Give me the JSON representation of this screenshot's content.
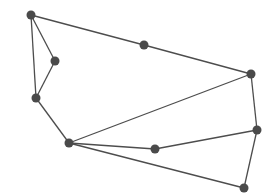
{
  "graph": {
    "width": 264,
    "height": 194,
    "colors": {
      "node": "#4a4a4a",
      "edge": "#4d4d4d",
      "background": "#ffffff"
    },
    "node_radius": 4.5,
    "nodes": [
      {
        "id": "A",
        "x": 31,
        "y": 15
      },
      {
        "id": "B",
        "x": 55,
        "y": 61
      },
      {
        "id": "C",
        "x": 36,
        "y": 98
      },
      {
        "id": "D",
        "x": 144,
        "y": 45
      },
      {
        "id": "E",
        "x": 69,
        "y": 143
      },
      {
        "id": "F",
        "x": 251,
        "y": 74
      },
      {
        "id": "G",
        "x": 257,
        "y": 130
      },
      {
        "id": "H",
        "x": 155,
        "y": 149
      },
      {
        "id": "I",
        "x": 244,
        "y": 188
      }
    ],
    "edges": [
      [
        "A",
        "B"
      ],
      [
        "A",
        "C"
      ],
      [
        "A",
        "D"
      ],
      [
        "B",
        "C"
      ],
      [
        "C",
        "E"
      ],
      [
        "D",
        "F"
      ],
      [
        "E",
        "F"
      ],
      [
        "E",
        "H"
      ],
      [
        "E",
        "I"
      ],
      [
        "F",
        "G"
      ],
      [
        "H",
        "G"
      ],
      [
        "G",
        "I"
      ]
    ]
  }
}
